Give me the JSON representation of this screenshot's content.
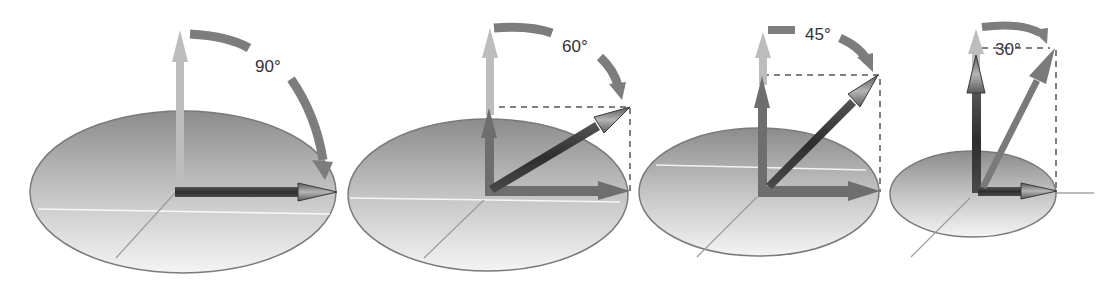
{
  "diagram": {
    "panels": [
      {
        "id": "panel-90",
        "angle_label": "90°",
        "angle": 90
      },
      {
        "id": "panel-60",
        "angle_label": "60°",
        "angle": 60
      },
      {
        "id": "panel-45",
        "angle_label": "45°",
        "angle": 45
      },
      {
        "id": "panel-30",
        "angle_label": "30°",
        "angle": 30
      }
    ],
    "colors": {
      "ellipse_top": "#8f8f8f",
      "ellipse_bottom": "#f2f2f2",
      "ellipse_stroke": "#7a7a7a",
      "light_arrow": "#bdbdbd",
      "medium_arrow": "#6e6e6e",
      "dark_arrow": "#3a3a3a",
      "arc": "#7d7d7d",
      "dashed": "#808080",
      "text": "#333333"
    }
  }
}
